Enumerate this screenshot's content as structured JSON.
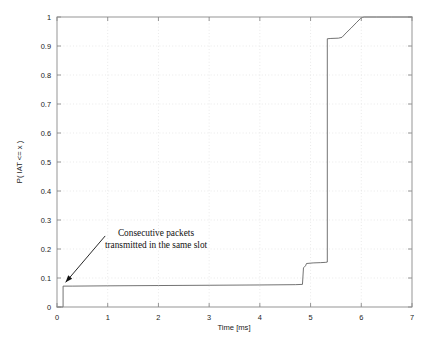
{
  "chart_data": {
    "type": "line",
    "title": "",
    "subtitle": "",
    "xlabel": "Time [ms]",
    "ylabel": "P( IAT <= x )",
    "xlim": [
      0,
      7
    ],
    "ylim": [
      0,
      1
    ],
    "xticks": [
      "0",
      "1",
      "2",
      "3",
      "4",
      "5",
      "6",
      "7"
    ],
    "xtick_values": [
      0,
      1,
      2,
      3,
      4,
      5,
      6,
      7
    ],
    "yticks": [
      "0",
      "0.1",
      "0.2",
      "0.3",
      "0.4",
      "0.5",
      "0.6",
      "0.7",
      "0.8",
      "0.9",
      "1"
    ],
    "ytick_values": [
      0,
      0.1,
      0.2,
      0.3,
      0.4,
      0.5,
      0.6,
      0.7,
      0.8,
      0.9,
      1
    ],
    "grid": true,
    "grid_style": "dotted",
    "legend": null,
    "legend_position": "none",
    "line_color": "#5a5a5a",
    "series": [
      {
        "name": "Empirical CDF of inter-arrival time",
        "x": [
          0.0,
          0.12,
          0.12,
          0.3,
          1.0,
          2.0,
          3.0,
          4.0,
          4.7,
          4.84,
          4.86,
          4.9,
          4.92,
          5.05,
          5.2,
          5.3,
          5.33,
          5.33,
          5.4,
          5.55,
          5.62,
          5.7,
          5.8,
          5.9,
          5.98,
          6.03,
          6.06,
          6.3,
          6.6,
          7.0
        ],
        "y": [
          0.0,
          0.0,
          0.072,
          0.072,
          0.073,
          0.074,
          0.075,
          0.076,
          0.077,
          0.078,
          0.135,
          0.142,
          0.15,
          0.152,
          0.153,
          0.154,
          0.155,
          0.925,
          0.926,
          0.927,
          0.93,
          0.945,
          0.962,
          0.98,
          0.994,
          0.999,
          1.0,
          1.0,
          1.0,
          1.0
        ]
      }
    ],
    "annotations": [
      {
        "name": "consecutive-packets-note",
        "text_line_1": "Consecutive packets",
        "text_line_2": "transmitted in the same slot",
        "arrow_from": [
          0.95,
          0.245
        ],
        "arrow_to": [
          0.17,
          0.085
        ]
      }
    ]
  }
}
